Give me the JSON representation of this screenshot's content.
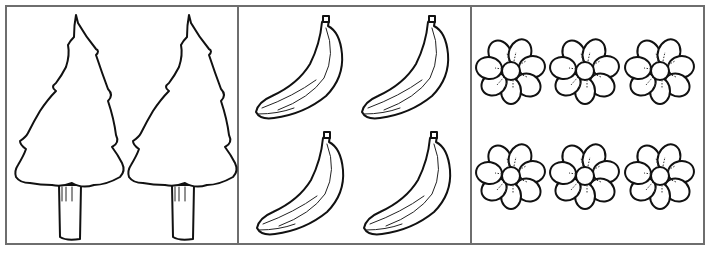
{
  "worksheet": {
    "panels": [
      {
        "id": "trees",
        "item": "pine-tree",
        "count": 2,
        "layout": "1 row × 2"
      },
      {
        "id": "bananas",
        "item": "banana",
        "count": 4,
        "layout": "2 rows × 2"
      },
      {
        "id": "flowers",
        "item": "flower",
        "count": 6,
        "layout": "2 rows × 3"
      }
    ],
    "colors": {
      "outline": "#111111",
      "border": "#6e6e6e",
      "background": "#ffffff"
    }
  }
}
